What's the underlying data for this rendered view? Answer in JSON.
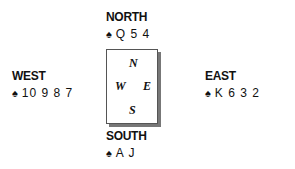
{
  "hands": {
    "north": {
      "seat": "NORTH",
      "suit": "♠",
      "cards": "Q 5 4"
    },
    "west": {
      "seat": "WEST",
      "suit": "♠",
      "cards": "10 9 8 7"
    },
    "east": {
      "seat": "EAST",
      "suit": "♠",
      "cards": "K 6 3 2"
    },
    "south": {
      "seat": "SOUTH",
      "suit": "♠",
      "cards": "A J"
    }
  },
  "compass": {
    "n": "N",
    "w": "W",
    "e": "E",
    "s": "S"
  }
}
